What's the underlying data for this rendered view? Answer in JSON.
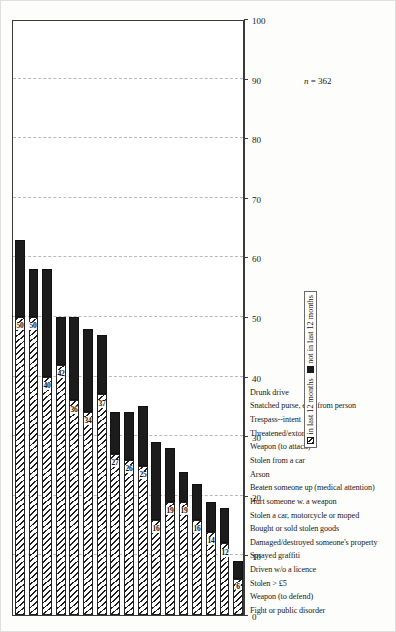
{
  "chart_data": {
    "type": "bar",
    "orientation": "horizontal",
    "stacked": true,
    "title": "",
    "subtitle": "",
    "xlabel": "",
    "ylabel": "",
    "xlim": [
      0,
      100
    ],
    "xticks": [
      0,
      10,
      20,
      30,
      40,
      50,
      60,
      70,
      80,
      90,
      100
    ],
    "grid": true,
    "grid_axis": "x",
    "legend_position": "bottom-right",
    "note": "n = 362",
    "note_italic_part": "n",
    "note_rest_part": " = 362",
    "categories": [
      "Fight or public disorder",
      "Weapon (to defend)",
      "Stolen > £5",
      "Driven w/o a licence",
      "Sprayed graffiti",
      "Damaged/destroyed someone's property",
      "Bought or sold stolen goods",
      "Stolen a car, motorcycle or moped",
      "Hurt someone w. a weapon",
      "Beaten someone up (medical attention)",
      "Arson",
      "Stolen from a car",
      "Weapon (to attack)",
      "Threatened/extortion",
      "Trespass--intent",
      "Snatched purse, etc., from person",
      "Drunk drive"
    ],
    "series": [
      {
        "name": "in last 12 months",
        "style": "hatched",
        "color": "#ffffff",
        "values": [
          50,
          50,
          40,
          42,
          36,
          34,
          37,
          27,
          26,
          25,
          16,
          19,
          19,
          16,
          14,
          12,
          6
        ]
      },
      {
        "name": "not in last 12 months",
        "style": "solid",
        "color": "#1c1c1c",
        "values": [
          13,
          8,
          18,
          8,
          14,
          14,
          10,
          7,
          8,
          10,
          13,
          9,
          5,
          6,
          5,
          6,
          3
        ]
      }
    ],
    "totals": [
      63,
      58,
      58,
      50,
      50,
      48,
      47,
      34,
      34,
      35,
      29,
      28,
      24,
      22,
      19,
      18,
      9
    ],
    "data_labels": [
      "50",
      "50",
      "40",
      "42",
      "36",
      "34",
      "37",
      "27",
      "26",
      "25",
      "16",
      "19",
      "19",
      "16",
      "14",
      "12",
      "6"
    ]
  },
  "legend": {
    "items": [
      {
        "label": "in last 12 months"
      },
      {
        "label": "not in last 12 months"
      }
    ]
  },
  "axis": {
    "tick_labels": [
      "0",
      "10",
      "20",
      "30",
      "40",
      "50",
      "60",
      "70",
      "80",
      "90",
      "100"
    ]
  }
}
